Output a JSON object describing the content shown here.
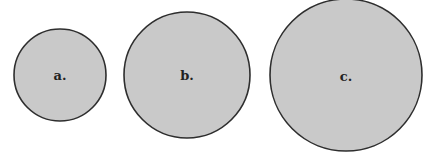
{
  "diagram": {
    "colors": {
      "fill": "#c9c9c9",
      "stroke": "#2e2e2e",
      "label": "#222222",
      "background": "#ffffff"
    },
    "circles": [
      {
        "label": "a.",
        "cx": 60,
        "cy": 75,
        "r": 46
      },
      {
        "label": "b.",
        "cx": 187,
        "cy": 75,
        "r": 63
      },
      {
        "label": "c.",
        "cx": 346,
        "cy": 75,
        "r": 76
      }
    ]
  }
}
